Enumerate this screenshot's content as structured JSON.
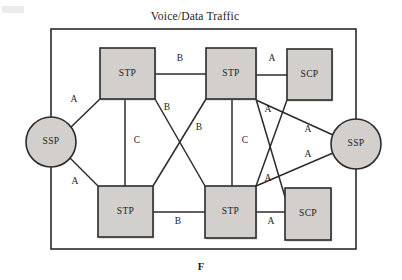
{
  "figure": {
    "title": "Voice/Data Traffic",
    "bottom_label": "F",
    "background": "#ffffff",
    "node_fill": "#d2cfcc",
    "stroke": "#2b2b2b"
  },
  "nodes": [
    {
      "id": "ssp-left",
      "label": "SSP",
      "shape": "circle",
      "cx": 51,
      "cy": 142,
      "r": 25
    },
    {
      "id": "ssp-right",
      "label": "SSP",
      "shape": "circle",
      "cx": 356,
      "cy": 144,
      "r": 25
    },
    {
      "id": "stp-top-left",
      "label": "STP",
      "shape": "rect",
      "x": 100,
      "y": 48,
      "w": 55,
      "h": 51
    },
    {
      "id": "stp-top-mid",
      "label": "STP",
      "shape": "rect",
      "x": 206,
      "y": 48,
      "w": 50,
      "h": 51
    },
    {
      "id": "scp-top-right",
      "label": "SCP",
      "shape": "rect",
      "x": 287,
      "y": 49,
      "w": 45,
      "h": 51
    },
    {
      "id": "stp-bottom-left",
      "label": "STP",
      "shape": "rect",
      "x": 98,
      "y": 186,
      "w": 55,
      "h": 51
    },
    {
      "id": "stp-bottom-mid",
      "label": "STP",
      "shape": "rect",
      "x": 205,
      "y": 186,
      "w": 51,
      "h": 52
    },
    {
      "id": "scp-bottom-right",
      "label": "SCP",
      "shape": "rect",
      "x": 285,
      "y": 188,
      "w": 46,
      "h": 52
    }
  ],
  "links": [
    {
      "id": "stp-tl--stp-tm",
      "label": "B",
      "label_x": 180,
      "label_y": 59,
      "x1": 155,
      "y1": 74,
      "x2": 206,
      "y2": 74
    },
    {
      "id": "stp-tm--scp-tr",
      "label": "A",
      "label_x": 272,
      "label_y": 59,
      "x1": 256,
      "y1": 75,
      "x2": 287,
      "y2": 75
    },
    {
      "id": "ssp-l--stp-tl",
      "label": "A",
      "label_x": 74,
      "label_y": 100,
      "x1": 70,
      "y1": 128,
      "x2": 100,
      "y2": 99
    },
    {
      "id": "ssp-l--stp-bl",
      "label": "A",
      "label_x": 75,
      "label_y": 182,
      "x1": 70,
      "y1": 158,
      "x2": 98,
      "y2": 186
    },
    {
      "id": "stp-tl--stp-bl",
      "label": "C",
      "label_x": 137,
      "label_y": 141,
      "x1": 125,
      "y1": 99,
      "x2": 125,
      "y2": 186
    },
    {
      "id": "stp-tm--stp-bm",
      "label": "C",
      "label_x": 245,
      "label_y": 141,
      "x1": 232,
      "y1": 99,
      "x2": 232,
      "y2": 186
    },
    {
      "id": "stp-tl--stp-bm",
      "label": "B",
      "label_x": 167,
      "label_y": 108,
      "x1": 155,
      "y1": 99,
      "x2": 205,
      "y2": 186
    },
    {
      "id": "stp-tm--stp-bl",
      "label": "B",
      "label_x": 199,
      "label_y": 128,
      "x1": 206,
      "y1": 99,
      "x2": 153,
      "y2": 186
    },
    {
      "id": "stp-bl--stp-bm",
      "label": "B",
      "label_x": 178,
      "label_y": 222,
      "x1": 153,
      "y1": 212,
      "x2": 205,
      "y2": 212
    },
    {
      "id": "stp-bm--scp-br",
      "label": "A",
      "label_x": 271,
      "label_y": 222,
      "x1": 256,
      "y1": 212,
      "x2": 285,
      "y2": 212
    },
    {
      "id": "stp-tm--scp-br",
      "label": "A",
      "label_x": 268,
      "label_y": 110,
      "x1": 256,
      "y1": 99,
      "x2": 285,
      "y2": 197
    },
    {
      "id": "stp-bm--scp-tr",
      "label": "A",
      "label_x": 268,
      "label_y": 179,
      "x1": 256,
      "y1": 186,
      "x2": 287,
      "y2": 100
    },
    {
      "id": "ssp-r--stp-tm",
      "label": "A",
      "label_x": 308,
      "label_y": 130,
      "x1": 333,
      "y1": 135,
      "x2": 256,
      "y2": 100
    },
    {
      "id": "ssp-r--stp-bm",
      "label": "A",
      "label_x": 308,
      "label_y": 155,
      "x1": 333,
      "y1": 153,
      "x2": 256,
      "y2": 186
    }
  ],
  "frame": {
    "left": 51,
    "right": 356,
    "top": 29,
    "bottom": 249
  }
}
